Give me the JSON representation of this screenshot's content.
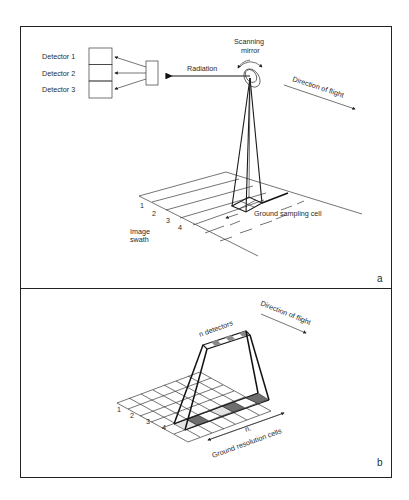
{
  "panel_a": {
    "letter": "a",
    "detectors": [
      {
        "label": "Detector 1"
      },
      {
        "label": "Detector 2"
      },
      {
        "label": "Detector 3"
      }
    ],
    "radiation_label": "Radiation",
    "mirror_label_line1": "Scanning",
    "mirror_label_line2": "mirror",
    "flight_label": "Direction of flight",
    "ground_cell_label": "Ground sampling cell",
    "swath_label_line1": "Image",
    "swath_label_line2": "swath",
    "scan_lines": [
      "1",
      "2",
      "3",
      "4"
    ]
  },
  "panel_b": {
    "letter": "b",
    "detectors_label": "n detectors",
    "flight_label": "Direction of flight",
    "n_label": "n.",
    "cells_label": "Ground resolution cells",
    "scan_lines": [
      "1",
      "2",
      "3",
      "4"
    ]
  },
  "colors": {
    "line": "#1a1a1a",
    "cell_dark": "#6e6e6e",
    "cell_light": "#e4e4e4",
    "background": "#ffffff"
  }
}
